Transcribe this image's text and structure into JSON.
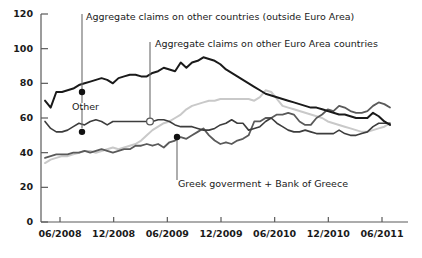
{
  "chart_data": {
    "type": "line",
    "title": "",
    "xlabel": "",
    "ylabel": "",
    "ylim": [
      0,
      120
    ],
    "yticks": [
      0,
      20,
      40,
      60,
      80,
      100,
      120
    ],
    "ytick_labels": [
      "0",
      "20",
      "40",
      "60",
      "80",
      "100",
      "120"
    ],
    "xticks": [
      "06/2008",
      "12/2008",
      "06/2009",
      "12/2009",
      "06/2010",
      "12/2010",
      "06/2011"
    ],
    "grid": false,
    "legend": "annotations-with-leader-lines",
    "x_start": "06/2008",
    "x_end": "06/2011",
    "series": [
      {
        "name": "Aggregate claims on other countries (outside Euro Area)",
        "color": "#1a1a1a",
        "width": 2.0,
        "marker_value": 75,
        "values": [
          70,
          66,
          75,
          75,
          76,
          77,
          79,
          80,
          81,
          82,
          83,
          82,
          80,
          83,
          84,
          85,
          85,
          84,
          84,
          86,
          87,
          89,
          88,
          87,
          92,
          89,
          92,
          93,
          95,
          94,
          93,
          91,
          88,
          86,
          84,
          82,
          80,
          78,
          76,
          74,
          73,
          72,
          71,
          70,
          69,
          68,
          67,
          66,
          66,
          65,
          64,
          63,
          62,
          62,
          61,
          60,
          60,
          60,
          63,
          61,
          58,
          56
        ]
      },
      {
        "name": "Other",
        "color": "#3d3d3d",
        "width": 1.6,
        "marker_value": 52,
        "values": [
          58,
          54,
          52,
          52,
          53,
          55,
          57,
          56,
          58,
          59,
          58,
          56,
          58,
          58,
          58,
          58,
          58,
          58,
          58,
          58,
          59,
          59,
          58,
          56,
          55,
          55,
          55,
          54,
          53,
          53,
          54,
          56,
          57,
          59,
          57,
          57,
          53,
          54,
          55,
          58,
          60,
          57,
          55,
          53,
          52,
          52,
          53,
          52,
          51,
          51,
          51,
          51,
          53,
          51,
          50,
          50,
          51,
          52,
          55,
          57,
          57,
          57
        ]
      },
      {
        "name": "Greek goverment + Bank of Greece",
        "color": "#5a5a5a",
        "width": 1.8,
        "marker_value": 49,
        "values": [
          37,
          38,
          39,
          39,
          39,
          40,
          40,
          41,
          40,
          41,
          42,
          41,
          40,
          41,
          42,
          42,
          44,
          44,
          45,
          44,
          45,
          43,
          46,
          47,
          49,
          48,
          50,
          52,
          54,
          50,
          47,
          45,
          46,
          45,
          47,
          48,
          50,
          58,
          58,
          60,
          60,
          62,
          62,
          63,
          62,
          58,
          56,
          56,
          60,
          62,
          65,
          64,
          67,
          66,
          64,
          63,
          63,
          64,
          67,
          69,
          68,
          66
        ]
      },
      {
        "name": "Aggregate claims on other Euro Area countries",
        "color": "#c9c9c9",
        "width": 2.0,
        "marker_value": 58,
        "values": [
          34,
          36,
          37,
          38,
          38,
          39,
          40,
          41,
          41,
          40,
          41,
          42,
          43,
          42,
          43,
          44,
          45,
          47,
          50,
          53,
          55,
          57,
          58,
          60,
          62,
          65,
          67,
          68,
          69,
          70,
          70,
          71,
          71,
          71,
          71,
          71,
          71,
          70,
          72,
          76,
          75,
          71,
          67,
          66,
          65,
          64,
          63,
          62,
          61,
          60,
          58,
          57,
          56,
          55,
          54,
          53,
          52,
          52,
          53,
          54,
          55,
          57
        ]
      }
    ],
    "annotations": [
      {
        "id": "annot-outside-euro",
        "text": "Aggregate claims on other countries (outside Euro Area)",
        "marker": "filled-dot",
        "target_series": "Aggregate claims on other countries (outside Euro Area)"
      },
      {
        "id": "annot-euro-area",
        "text": "Aggregate claims on other Euro Area countries",
        "marker": "open-circle",
        "target_series": "Aggregate claims on other Euro Area countries"
      },
      {
        "id": "annot-other",
        "text": "Other",
        "marker": "filled-dot",
        "target_series": "Other"
      },
      {
        "id": "annot-greek",
        "text": "Greek goverment + Bank of Greece",
        "marker": "filled-dot",
        "target_series": "Greek goverment + Bank of Greece"
      }
    ],
    "colors": {
      "axis": "#5a5a5a",
      "text": "#1a1a1a",
      "background": "#ffffff",
      "leader_line": "#6b6b6b"
    }
  }
}
